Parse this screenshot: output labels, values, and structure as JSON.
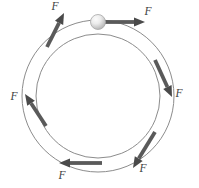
{
  "figure": {
    "background_color": "#ffffff",
    "track": {
      "name": "circular-track",
      "center_x": 98,
      "center_y": 96,
      "outer_radius": 76,
      "inner_radius": 62,
      "stroke_color": "#8c8c8c",
      "stroke_width": 1.0
    },
    "ball": {
      "name": "ball",
      "center_x": 98,
      "center_y": 22,
      "radius": 7.5,
      "fill_light": "#f4f4f4",
      "fill_dark": "#b9b9b9",
      "outline_color": "#a8a8a8"
    },
    "arrow_color": "#5a5a5a",
    "arrow_color_dark": "#4a4a4a",
    "label_color": "#3d3d3d",
    "label_text": "F",
    "arrows": [
      {
        "name": "force-arrow-top-left",
        "label": "F",
        "tail_x": 47,
        "tail_y": 47,
        "head_x": 64,
        "head_y": 13,
        "label_x": 55,
        "label_y": 10,
        "direction": "up-right"
      },
      {
        "name": "force-arrow-top-right",
        "label": "F",
        "tail_x": 104,
        "tail_y": 22,
        "head_x": 145,
        "head_y": 22,
        "label_x": 148,
        "label_y": 15,
        "direction": "right"
      },
      {
        "name": "force-arrow-right",
        "label": "F",
        "tail_x": 155,
        "tail_y": 60,
        "head_x": 172,
        "head_y": 97,
        "label_x": 179,
        "label_y": 97,
        "direction": "down-right"
      },
      {
        "name": "force-arrow-bottom-right",
        "label": "F",
        "tail_x": 155,
        "tail_y": 132,
        "head_x": 133,
        "head_y": 168,
        "label_x": 143,
        "label_y": 172,
        "direction": "down-left"
      },
      {
        "name": "force-arrow-bottom",
        "label": "F",
        "tail_x": 102,
        "tail_y": 163,
        "head_x": 59,
        "head_y": 163,
        "label_x": 62,
        "label_y": 179,
        "direction": "left"
      },
      {
        "name": "force-arrow-left",
        "label": "F",
        "tail_x": 46,
        "tail_y": 126,
        "head_x": 25,
        "head_y": 94,
        "label_x": 14,
        "label_y": 100,
        "direction": "up-left"
      }
    ]
  }
}
